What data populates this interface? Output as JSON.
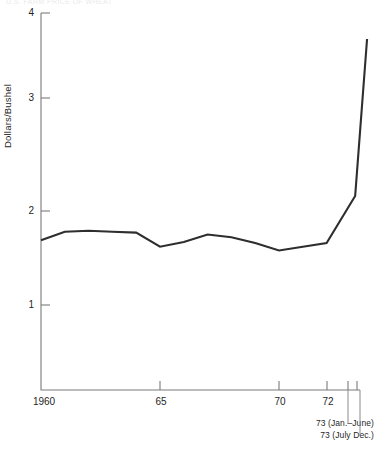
{
  "figure": {
    "clipped_header_text": "U.S. FARM PRICE OF WHEAT",
    "ylabel": "Dollars/Bushel"
  },
  "axes": {
    "y_ticks": [
      {
        "label": "4",
        "value": 4
      },
      {
        "label": "3",
        "value": 3
      },
      {
        "label": "2",
        "value": 2
      },
      {
        "label": "1",
        "value": 1
      }
    ],
    "x_ticks": [
      {
        "label": "1960",
        "value": 1960
      },
      {
        "label": "65",
        "value": 1965
      },
      {
        "label": "70",
        "value": 1970
      },
      {
        "label": "72",
        "value": 1972
      }
    ]
  },
  "annotations": [
    {
      "label": "73 (Jan.–June)"
    },
    {
      "label": "73 (July Dec.)"
    }
  ],
  "chart_data": {
    "type": "line",
    "title": "U.S. FARM PRICE OF WHEAT",
    "xlabel": "",
    "ylabel": "Dollars/Bushel",
    "xlim": [
      1960,
      1973.9
    ],
    "ylim": [
      0.55,
      4.0
    ],
    "grid": false,
    "legend": null,
    "x": [
      1960,
      1961,
      1962,
      1963,
      1964,
      1965,
      1966,
      1967,
      1968,
      1969,
      1970,
      1971,
      1972,
      1973.2,
      1973.7
    ],
    "x_labels": [
      "1960",
      "1961",
      "1962",
      "1963",
      "1964",
      "65",
      "1966",
      "1967",
      "1968",
      "1969",
      "70",
      "1971",
      "72",
      "73 (Jan.–June)",
      "73 (July Dec.)"
    ],
    "values": [
      1.69,
      1.78,
      1.79,
      1.78,
      1.77,
      1.62,
      1.67,
      1.75,
      1.72,
      1.66,
      1.58,
      1.62,
      1.66,
      2.16,
      3.83
    ],
    "series": [
      {
        "name": "Farm price of wheat",
        "color": "#2e2e2e",
        "values": [
          1.69,
          1.78,
          1.79,
          1.78,
          1.77,
          1.62,
          1.67,
          1.75,
          1.72,
          1.66,
          1.58,
          1.62,
          1.66,
          2.16,
          3.83
        ]
      }
    ]
  }
}
